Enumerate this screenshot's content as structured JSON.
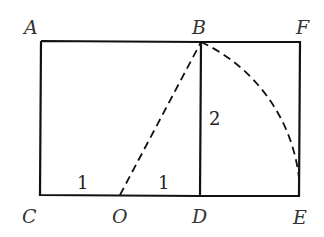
{
  "diagram": {
    "points": {
      "A": {
        "label": "A",
        "x": 41,
        "y": 41
      },
      "B": {
        "label": "B",
        "x": 201,
        "y": 42
      },
      "F": {
        "label": "F",
        "x": 300,
        "y": 42
      },
      "C": {
        "label": "C",
        "x": 40,
        "y": 195
      },
      "O": {
        "label": "O",
        "x": 120,
        "y": 195
      },
      "D": {
        "label": "D",
        "x": 200,
        "y": 196
      },
      "E": {
        "label": "E",
        "x": 299,
        "y": 196
      }
    },
    "segment_labels": {
      "CO": "1",
      "OD": "1",
      "BD": "2"
    },
    "colors": {
      "line": "#111111",
      "label": "#333333"
    }
  }
}
